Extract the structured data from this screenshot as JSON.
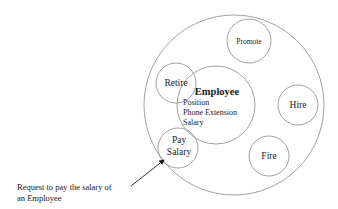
{
  "diagram": {
    "type": "object-encapsulation",
    "object": {
      "name": "Employee",
      "attributes": [
        "Position",
        "Phone Extension",
        "Salary"
      ]
    },
    "methods": [
      {
        "id": "promote",
        "label": "Promote"
      },
      {
        "id": "retire",
        "label": "Retire"
      },
      {
        "id": "hire",
        "label": "Hire"
      },
      {
        "id": "fire",
        "label": "Fire"
      },
      {
        "id": "pay-salary",
        "label_line1": "Pay",
        "label_line2": "Salary"
      }
    ],
    "annotation": {
      "line1": "Request to pay the salary of",
      "line2": "an Employee"
    },
    "colors": {
      "stroke": "#8a8a8a",
      "text": "#1a1a1a",
      "background": "#ffffff"
    }
  }
}
